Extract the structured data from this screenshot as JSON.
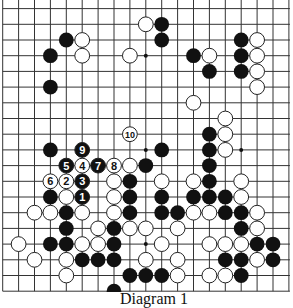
{
  "diagram": {
    "caption": "Diagram 1",
    "grid": {
      "cols": 19,
      "rows": 19,
      "x0": 2.7,
      "y0": 8.6,
      "dx": 15.9,
      "dy": 15.7,
      "stone_radius": 7.4
    },
    "colors": {
      "line": "#333333",
      "black": "#111111",
      "white": "#ffffff",
      "stone_outline": "#222222"
    },
    "star_points": [
      [
        9,
        3
      ],
      [
        9,
        9
      ],
      [
        15,
        9
      ],
      [
        9,
        15
      ]
    ],
    "black_stones": [
      [
        10,
        1
      ],
      [
        4,
        2
      ],
      [
        10,
        2
      ],
      [
        15,
        2
      ],
      [
        3,
        3
      ],
      [
        12,
        3
      ],
      [
        15,
        3
      ],
      [
        13,
        4
      ],
      [
        15,
        4
      ],
      [
        3,
        5
      ],
      [
        13,
        8
      ],
      [
        3,
        9
      ],
      [
        10,
        9
      ],
      [
        13,
        9
      ],
      [
        9,
        10
      ],
      [
        13,
        10
      ],
      [
        8,
        11
      ],
      [
        13,
        11
      ],
      [
        3,
        12
      ],
      [
        8,
        12
      ],
      [
        10,
        12
      ],
      [
        12,
        12
      ],
      [
        13,
        12
      ],
      [
        14,
        12
      ],
      [
        4,
        13
      ],
      [
        8,
        13
      ],
      [
        10,
        13
      ],
      [
        11,
        13
      ],
      [
        14,
        13
      ],
      [
        15,
        13
      ],
      [
        4,
        14
      ],
      [
        7,
        14
      ],
      [
        15,
        14
      ],
      [
        3,
        15
      ],
      [
        4,
        15
      ],
      [
        7,
        15
      ],
      [
        16,
        15
      ],
      [
        17,
        15
      ],
      [
        5,
        16
      ],
      [
        6,
        16
      ],
      [
        7,
        16
      ],
      [
        14,
        16
      ],
      [
        15,
        16
      ],
      [
        17,
        16
      ],
      [
        8,
        17
      ],
      [
        9,
        17
      ],
      [
        10,
        17
      ],
      [
        15,
        17
      ],
      [
        7,
        18
      ]
    ],
    "white_stones": [
      [
        9,
        1
      ],
      [
        5,
        2
      ],
      [
        16,
        2
      ],
      [
        5,
        3
      ],
      [
        8,
        3
      ],
      [
        13,
        3
      ],
      [
        16,
        3
      ],
      [
        16,
        4
      ],
      [
        16,
        5
      ],
      [
        12,
        6
      ],
      [
        14,
        7
      ],
      [
        14,
        8
      ],
      [
        14,
        9
      ],
      [
        8,
        10
      ],
      [
        7,
        11
      ],
      [
        10,
        11
      ],
      [
        12,
        11
      ],
      [
        15,
        11
      ],
      [
        4,
        12
      ],
      [
        7,
        12
      ],
      [
        15,
        12
      ],
      [
        2,
        13
      ],
      [
        3,
        13
      ],
      [
        5,
        13
      ],
      [
        7,
        13
      ],
      [
        12,
        13
      ],
      [
        13,
        13
      ],
      [
        16,
        13
      ],
      [
        6,
        14
      ],
      [
        8,
        14
      ],
      [
        9,
        14
      ],
      [
        11,
        14
      ],
      [
        16,
        14
      ],
      [
        1,
        15
      ],
      [
        5,
        15
      ],
      [
        6,
        15
      ],
      [
        10,
        15
      ],
      [
        13,
        15
      ],
      [
        14,
        15
      ],
      [
        15,
        15
      ],
      [
        2,
        16
      ],
      [
        4,
        16
      ],
      [
        9,
        16
      ],
      [
        11,
        16
      ],
      [
        16,
        16
      ],
      [
        4,
        17
      ],
      [
        11,
        17
      ],
      [
        13,
        17
      ],
      [
        14,
        17
      ]
    ],
    "numbered_moves": [
      {
        "n": "1",
        "color": "black",
        "col": 5,
        "row": 12
      },
      {
        "n": "2",
        "color": "white",
        "col": 4,
        "row": 11
      },
      {
        "n": "3",
        "color": "black",
        "col": 5,
        "row": 11
      },
      {
        "n": "4",
        "color": "white",
        "col": 5,
        "row": 10
      },
      {
        "n": "5",
        "color": "black",
        "col": 4,
        "row": 10
      },
      {
        "n": "6",
        "color": "white",
        "col": 3,
        "row": 11
      },
      {
        "n": "7",
        "color": "black",
        "col": 6,
        "row": 10
      },
      {
        "n": "8",
        "color": "white",
        "col": 7,
        "row": 10
      },
      {
        "n": "9",
        "color": "black",
        "col": 5,
        "row": 9
      },
      {
        "n": "10",
        "color": "white",
        "col": 8,
        "row": 8
      }
    ]
  }
}
